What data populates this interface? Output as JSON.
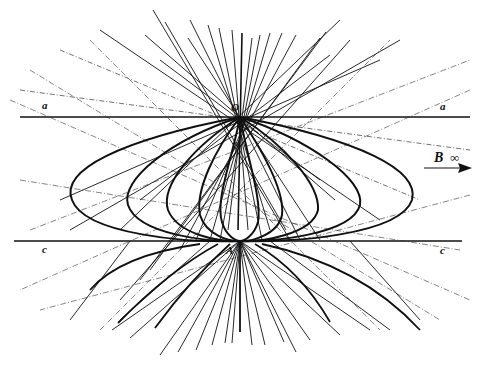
{
  "figure": {
    "type": "geometric-construction",
    "colors": {
      "ink": "#111111",
      "background": "#ffffff"
    }
  },
  "labels": {
    "a_left": "a",
    "a_right": "a",
    "c_left": "c",
    "c_right": "c",
    "point_O": "O",
    "point_A": "A",
    "point_B": "B",
    "infinity": "∞"
  },
  "geometry": {
    "line_a_y": 117,
    "line_c_y": 241,
    "O": [
      240,
      117
    ],
    "A": [
      240,
      241
    ],
    "loop_extents_x": [
      72,
      128,
      168,
      200,
      222,
      258,
      282,
      318,
      360,
      412
    ]
  },
  "arrow": {
    "label": "B",
    "symbol": "∞",
    "direction": "right"
  }
}
